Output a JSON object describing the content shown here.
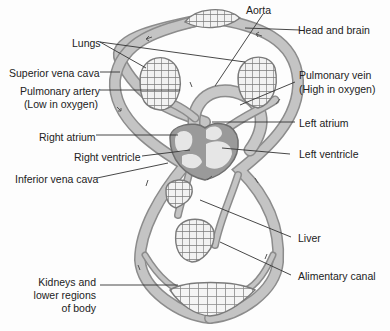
{
  "diagram": {
    "colors": {
      "vessel_fill": "#bdbdbd",
      "vessel_edge": "#8c8c8c",
      "heart_fill": "#9a9a9a",
      "chamber_fill": "#e6e6e6",
      "mesh": "#7a7a7a",
      "text": "#222222",
      "leader": "#333333"
    },
    "labels": {
      "aorta": "Aorta",
      "head_and_brain": "Head and brain",
      "lungs": "Lungs",
      "superior_vena_cava": "Superior vena cava",
      "pulmonary_artery_1": "Pulmonary artery",
      "pulmonary_artery_2": "(Low in oxygen)",
      "pulmonary_vein_1": "Pulmonary vein",
      "pulmonary_vein_2": "(High in oxygen)",
      "left_atrium": "Left atrium",
      "right_atrium": "Right atrium",
      "right_ventricle": "Right ventricle",
      "left_ventricle": "Left ventricle",
      "inferior_vena_cava": "Inferior vena cava",
      "liver": "Liver",
      "alimentary_canal": "Alimentary canal",
      "kidneys_1": "Kidneys and",
      "kidneys_2": "lower regions",
      "kidneys_3": "of body"
    }
  }
}
